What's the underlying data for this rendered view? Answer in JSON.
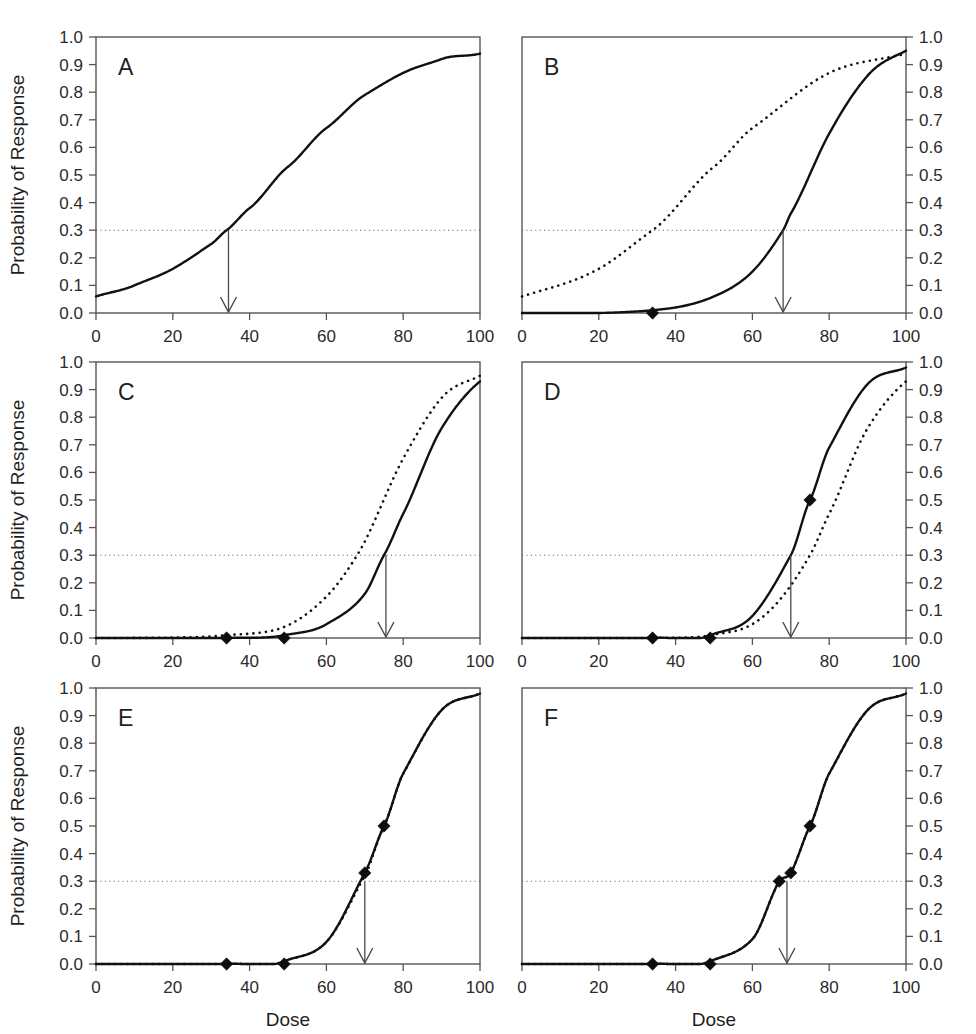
{
  "figure": {
    "title": "",
    "panel_count": 6,
    "xlabel": "Dose",
    "ylabel": "Probability of Response",
    "threshold_label": "0.3",
    "threshold_value": 0.3,
    "xlim": [
      0,
      100
    ],
    "ylim": [
      0,
      1
    ],
    "x_ticks": [
      0,
      20,
      40,
      60,
      80,
      100
    ],
    "y_ticks": [
      "0.0",
      "0.1",
      "0.2",
      "0.3",
      "0.4",
      "0.5",
      "0.6",
      "0.7",
      "0.8",
      "0.9",
      "1.0"
    ],
    "y_tick_values": [
      0,
      0.1,
      0.2,
      0.3,
      0.4,
      0.5,
      0.6,
      0.7,
      0.8,
      0.9,
      1.0
    ],
    "colors": {
      "curve": "#111111",
      "axis": "#555555",
      "threshold": "#6e6e6e",
      "arrow": "#4a4a4a",
      "marker": "#0d0d0d",
      "background": "#ffffff"
    }
  },
  "chart_data": {
    "type": "line",
    "title": "",
    "xlabel": "Dose",
    "ylabel": "Probability of Response",
    "xlim": [
      0,
      100
    ],
    "ylim": [
      0,
      1
    ],
    "x_ticks": [
      0,
      20,
      40,
      60,
      80,
      100
    ],
    "y_ticks": [
      0,
      0.1,
      0.2,
      0.3,
      0.4,
      0.5,
      0.6,
      0.7,
      0.8,
      0.9,
      1.0
    ],
    "grid": false,
    "legend": "none",
    "annotations": {
      "threshold_line": 0.3,
      "arrow_meaning": "next dose selected at probability = 0.3"
    },
    "panels": [
      {
        "label": "A",
        "ylabel_shown": true,
        "xlabel_shown": false,
        "y_axis_side": "left",
        "solid": {
          "name": "current estimate",
          "shape": "logistic",
          "x50": 47,
          "slope": 0.042,
          "lo": 0.0,
          "hi": 1.0,
          "points": [
            [
              0,
              0.06
            ],
            [
              10,
              0.1
            ],
            [
              20,
              0.16
            ],
            [
              30,
              0.25
            ],
            [
              34,
              0.3
            ],
            [
              40,
              0.38
            ],
            [
              50,
              0.53
            ],
            [
              60,
              0.67
            ],
            [
              70,
              0.79
            ],
            [
              80,
              0.87
            ],
            [
              90,
              0.92
            ],
            [
              100,
              0.94
            ]
          ]
        },
        "dotted": null,
        "arrow_x": 34.5,
        "markers": []
      },
      {
        "label": "B",
        "ylabel_shown": false,
        "xlabel_shown": false,
        "y_axis_side": "right",
        "solid": {
          "name": "updated estimate",
          "shape": "logistic",
          "x50": 76,
          "slope": 0.105,
          "lo": 0.0,
          "hi": 1.0,
          "points": [
            [
              0,
              0.0
            ],
            [
              20,
              0.0
            ],
            [
              34,
              0.01
            ],
            [
              40,
              0.02
            ],
            [
              50,
              0.06
            ],
            [
              60,
              0.15
            ],
            [
              68,
              0.3
            ],
            [
              70,
              0.36
            ],
            [
              80,
              0.65
            ],
            [
              90,
              0.86
            ],
            [
              100,
              0.95
            ]
          ]
        },
        "dotted": {
          "name": "prior estimate",
          "shape": "logistic",
          "x50": 47,
          "slope": 0.042,
          "lo": 0.0,
          "hi": 1.0,
          "points": [
            [
              0,
              0.06
            ],
            [
              20,
              0.16
            ],
            [
              34,
              0.3
            ],
            [
              50,
              0.53
            ],
            [
              60,
              0.67
            ],
            [
              80,
              0.87
            ],
            [
              100,
              0.94
            ]
          ]
        },
        "arrow_x": 68,
        "markers": [
          {
            "x": 34,
            "y": 0.0
          }
        ]
      },
      {
        "label": "C",
        "ylabel_shown": true,
        "xlabel_shown": false,
        "y_axis_side": "left",
        "solid": {
          "name": "updated estimate",
          "shape": "logistic",
          "x50": 82,
          "slope": 0.11,
          "lo": 0.0,
          "hi": 1.0,
          "points": [
            [
              0,
              0.0
            ],
            [
              34,
              0.0
            ],
            [
              49,
              0.01
            ],
            [
              60,
              0.05
            ],
            [
              70,
              0.16
            ],
            [
              75,
              0.3
            ],
            [
              80,
              0.45
            ],
            [
              90,
              0.76
            ],
            [
              100,
              0.93
            ]
          ]
        },
        "dotted": {
          "name": "prior estimate",
          "shape": "logistic",
          "x50": 76,
          "slope": 0.105,
          "lo": 0.0,
          "hi": 1.0,
          "points": [
            [
              0,
              0.0
            ],
            [
              34,
              0.01
            ],
            [
              49,
              0.04
            ],
            [
              60,
              0.15
            ],
            [
              68,
              0.3
            ],
            [
              80,
              0.65
            ],
            [
              90,
              0.87
            ],
            [
              100,
              0.95
            ]
          ]
        },
        "arrow_x": 75.5,
        "markers": [
          {
            "x": 34,
            "y": 0.0
          },
          {
            "x": 49,
            "y": 0.0
          }
        ]
      },
      {
        "label": "D",
        "ylabel_shown": false,
        "xlabel_shown": false,
        "y_axis_side": "right",
        "solid": {
          "name": "updated estimate",
          "shape": "logistic",
          "x50": 75,
          "slope": 0.108,
          "lo": 0.0,
          "hi": 1.0,
          "points": [
            [
              0,
              0.0
            ],
            [
              34,
              0.0
            ],
            [
              49,
              0.01
            ],
            [
              60,
              0.08
            ],
            [
              70,
              0.3
            ],
            [
              75,
              0.5
            ],
            [
              80,
              0.69
            ],
            [
              90,
              0.92
            ],
            [
              100,
              0.98
            ]
          ]
        },
        "dotted": {
          "name": "prior estimate",
          "shape": "logistic",
          "x50": 82,
          "slope": 0.11,
          "lo": 0.0,
          "hi": 1.0,
          "points": [
            [
              0,
              0.0
            ],
            [
              34,
              0.0
            ],
            [
              49,
              0.01
            ],
            [
              60,
              0.05
            ],
            [
              75,
              0.3
            ],
            [
              80,
              0.45
            ],
            [
              90,
              0.76
            ],
            [
              100,
              0.93
            ]
          ]
        },
        "arrow_x": 70,
        "markers": [
          {
            "x": 34,
            "y": 0.0
          },
          {
            "x": 49,
            "y": 0.0
          },
          {
            "x": 75,
            "y": 0.5
          }
        ]
      },
      {
        "label": "E",
        "ylabel_shown": true,
        "xlabel_shown": true,
        "y_axis_side": "left",
        "solid": {
          "name": "updated estimate",
          "shape": "logistic",
          "x50": 75,
          "slope": 0.108,
          "lo": 0.0,
          "hi": 1.0,
          "points": [
            [
              0,
              0.0
            ],
            [
              34,
              0.0
            ],
            [
              49,
              0.01
            ],
            [
              60,
              0.08
            ],
            [
              70,
              0.33
            ],
            [
              75,
              0.5
            ],
            [
              80,
              0.69
            ],
            [
              90,
              0.92
            ],
            [
              100,
              0.98
            ]
          ]
        },
        "dotted": {
          "name": "prior estimate",
          "shape": "logistic",
          "x50": 75,
          "slope": 0.106,
          "lo": 0.0,
          "hi": 1.0,
          "points": [
            [
              0,
              0.0
            ],
            [
              34,
              0.0
            ],
            [
              49,
              0.01
            ],
            [
              60,
              0.08
            ],
            [
              70,
              0.32
            ],
            [
              75,
              0.5
            ],
            [
              80,
              0.69
            ],
            [
              90,
              0.92
            ],
            [
              100,
              0.98
            ]
          ]
        },
        "arrow_x": 70,
        "markers": [
          {
            "x": 34,
            "y": 0.0
          },
          {
            "x": 49,
            "y": 0.0
          },
          {
            "x": 70,
            "y": 0.33
          },
          {
            "x": 75,
            "y": 0.5
          }
        ]
      },
      {
        "label": "F",
        "ylabel_shown": false,
        "xlabel_shown": true,
        "y_axis_side": "right",
        "solid": {
          "name": "updated estimate",
          "shape": "logistic",
          "x50": 75,
          "slope": 0.107,
          "lo": 0.0,
          "hi": 1.0,
          "points": [
            [
              0,
              0.0
            ],
            [
              34,
              0.0
            ],
            [
              49,
              0.01
            ],
            [
              60,
              0.09
            ],
            [
              67,
              0.3
            ],
            [
              70,
              0.33
            ],
            [
              75,
              0.5
            ],
            [
              80,
              0.69
            ],
            [
              90,
              0.92
            ],
            [
              100,
              0.98
            ]
          ]
        },
        "dotted": {
          "name": "prior estimate",
          "shape": "logistic",
          "x50": 75,
          "slope": 0.107,
          "lo": 0.0,
          "hi": 1.0,
          "points": [
            [
              0,
              0.0
            ],
            [
              34,
              0.0
            ],
            [
              49,
              0.01
            ],
            [
              60,
              0.09
            ],
            [
              67,
              0.3
            ],
            [
              70,
              0.33
            ],
            [
              75,
              0.5
            ],
            [
              80,
              0.69
            ],
            [
              90,
              0.92
            ],
            [
              100,
              0.98
            ]
          ]
        },
        "arrow_x": 69,
        "markers": [
          {
            "x": 34,
            "y": 0.0
          },
          {
            "x": 49,
            "y": 0.0
          },
          {
            "x": 67,
            "y": 0.3
          },
          {
            "x": 70,
            "y": 0.33
          },
          {
            "x": 75,
            "y": 0.5
          }
        ]
      }
    ]
  },
  "layout": {
    "columns": 2,
    "rows": 3,
    "panel_plot_width": 384,
    "panel_plot_height": 276,
    "col_x": [
      96,
      522
    ],
    "row_y": [
      37,
      362,
      688
    ]
  }
}
